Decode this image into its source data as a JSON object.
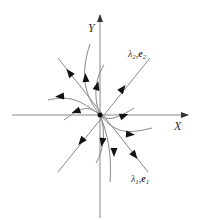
{
  "diagram": {
    "axes": {
      "x_label": "X",
      "y_label": "Y"
    },
    "eigen_labels": {
      "e2": {
        "lambda": "λ",
        "lambda_sub": "2",
        "sep": ",",
        "vec": "e",
        "vec_sub": "2"
      },
      "e1": {
        "lambda": "λ",
        "lambda_sub": "1",
        "sep": ",",
        "vec": "e",
        "vec_sub": "1"
      }
    },
    "colors": {
      "line": "#7a7a7a",
      "arrow": "#111111",
      "origin": "#111111"
    },
    "trajectory_direction": "outward from origin"
  }
}
